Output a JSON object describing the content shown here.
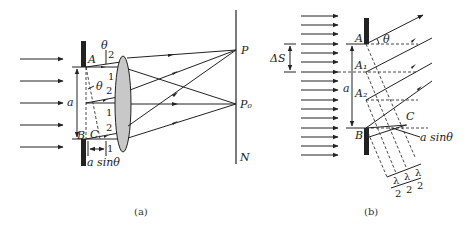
{
  "figure_a": {
    "caption": "(a)",
    "labels": {
      "A": "A",
      "B": "B",
      "C": "C",
      "theta_top": "θ",
      "theta_mid": "θ",
      "a": "a",
      "a_sin_theta": "a sinθ",
      "P": "P",
      "P0": "P₀",
      "N": "N"
    },
    "ray_numbers": [
      "2",
      "1",
      "2",
      "1",
      "2",
      "1"
    ]
  },
  "figure_b": {
    "caption": "(b)",
    "labels": {
      "A": "A",
      "A1": "A₁",
      "A2": "A₂",
      "B": "B",
      "C": "C",
      "theta": "θ",
      "delta_s": "ΔS",
      "a": "a",
      "a_sin_theta": "a sinθ",
      "lambda": "λ",
      "two": "2"
    }
  },
  "colors": {
    "ink": "#222222",
    "lens_fill": "#c8c8c8",
    "background": "#ffffff"
  }
}
